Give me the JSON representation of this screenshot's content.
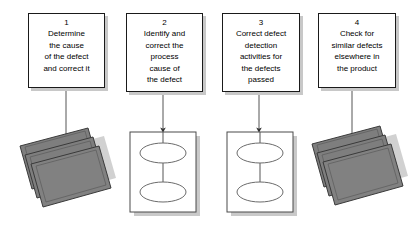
{
  "diagram": {
    "type": "process-flow",
    "title": "",
    "steps": [
      {
        "number": "1",
        "text": "Determine\nthe cause\nof the defect\nand correct it",
        "box": {
          "x": 28,
          "y": 13,
          "w": 77,
          "h": 75
        },
        "target": {
          "kind": "stacked-plates",
          "x": 19,
          "y": 130,
          "w": 95,
          "h": 78
        },
        "arrow": {
          "x": 66,
          "y1": 88,
          "y2": 148
        }
      },
      {
        "number": "2",
        "text": "Identify and\ncorrect the\nprocess\ncause of\nthe defect",
        "box": {
          "x": 126,
          "y": 13,
          "w": 77,
          "h": 79
        },
        "target": {
          "kind": "two-ellipse-sheet",
          "x": 130,
          "y": 132,
          "w": 66,
          "h": 80
        },
        "arrow": {
          "x": 163,
          "y1": 92,
          "y2": 131
        }
      },
      {
        "number": "3",
        "text": "Correct defect\ndetection\nactivities for\nthe defects\npassed",
        "box": {
          "x": 222,
          "y": 13,
          "w": 78,
          "h": 79
        },
        "target": {
          "kind": "two-ellipse-sheet",
          "x": 227,
          "y": 132,
          "w": 66,
          "h": 80
        },
        "arrow": {
          "x": 259,
          "y1": 92,
          "y2": 131
        }
      },
      {
        "number": "4",
        "text": "Check for\nsimilar defects\nelsewhere in\nthe product",
        "box": {
          "x": 318,
          "y": 13,
          "w": 78,
          "h": 75
        },
        "target": {
          "kind": "stacked-plates",
          "x": 311,
          "y": 128,
          "w": 95,
          "h": 78
        },
        "arrow": {
          "x": 352,
          "y1": 88,
          "y2": 146
        }
      }
    ],
    "colors": {
      "background": "#ffffff",
      "box_fill": "#ffffff",
      "box_border": "#1a1a1a",
      "box_shadow": "#c8c8c8",
      "plate_fill": "#808080",
      "plate_border": "#3c3c3c",
      "plate_shadow": "#c0c0c0",
      "sheet_fill": "#ffffff",
      "sheet_border": "#555555",
      "sheet_shadow": "#c8c8c8",
      "ellipse_stroke": "#666666",
      "arrow": "#444444",
      "text": "#000000"
    }
  }
}
